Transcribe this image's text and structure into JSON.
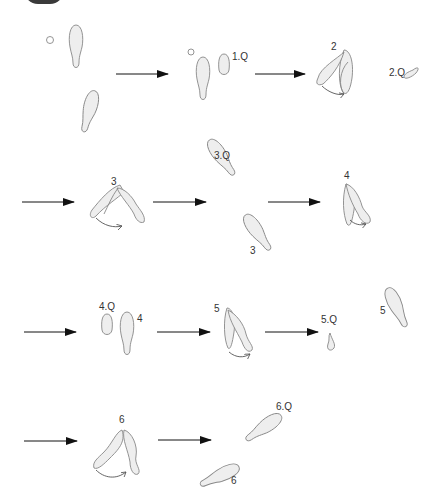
{
  "diagram": {
    "type": "dance-step footprint sequence",
    "colors": {
      "outline": "#888888",
      "fill": "#eeeeee",
      "arrow": "#111111",
      "text": "#333333"
    },
    "labels": {
      "step1Q": "1.Q",
      "step2": "2",
      "step2Q": "2.Q",
      "step3_pivot": "3",
      "step3Q": "3.Q",
      "step3": "3",
      "step4_pivot": "4",
      "step4Q": "4.Q",
      "step4": "4",
      "step5_pivot": "5",
      "step5Q": "5.Q",
      "step5": "5",
      "step6_pivot": "6",
      "step6Q": "6.Q",
      "step6": "6"
    },
    "rows": [
      {
        "row": 1,
        "frames": [
          "start",
          "1.Q",
          "2",
          "2.Q"
        ]
      },
      {
        "row": 2,
        "frames": [
          "3",
          "3.Q / 3",
          "4"
        ]
      },
      {
        "row": 3,
        "frames": [
          "4.Q / 4",
          "5",
          "5.Q",
          "5"
        ]
      },
      {
        "row": 4,
        "frames": [
          "6",
          "6.Q / 6"
        ]
      }
    ]
  }
}
